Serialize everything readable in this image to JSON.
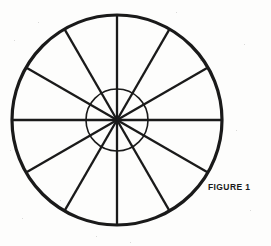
{
  "page": {
    "width": 271,
    "height": 246,
    "background_color": "#fdfdfc",
    "ink_color": "#1a1a1a"
  },
  "figure": {
    "name": "spoked-wheel-diagram",
    "caption": "FIGURE 1",
    "caption_position": {
      "x": 208,
      "y": 182
    },
    "center": {
      "x": 117,
      "y": 120
    },
    "outer_circle": {
      "radius": 105,
      "stroke_width": 3.2,
      "stroke_color": "#1a1a1a",
      "fill": "none"
    },
    "inner_circle": {
      "radius": 31,
      "stroke_width": 1.6,
      "stroke_color": "#1a1a1a",
      "fill": "none"
    },
    "spokes": {
      "count": 12,
      "angle_step_degrees": 30,
      "start_angle_degrees": 90,
      "stroke_width": 2.3,
      "stroke_color": "#1a1a1a",
      "angles_degrees": [
        90,
        120,
        150,
        180,
        210,
        240,
        270,
        300,
        330,
        0,
        30,
        60
      ]
    }
  },
  "chart_data": {
    "type": "pie",
    "title": "FIGURE 1",
    "subtitle": "",
    "xlabel": "",
    "ylabel": "",
    "legend_position": "none",
    "grid": false,
    "categories": [
      "Sector 1",
      "Sector 2",
      "Sector 3",
      "Sector 4",
      "Sector 5",
      "Sector 6",
      "Sector 7",
      "Sector 8",
      "Sector 9",
      "Sector 10",
      "Sector 11",
      "Sector 12"
    ],
    "values": [
      30,
      30,
      30,
      30,
      30,
      30,
      30,
      30,
      30,
      30,
      30,
      30
    ],
    "value_unit": "degrees",
    "annotations": [
      "Outer rim circle, radius 105 px",
      "Inner hub circle, radius 31 px",
      "12 equal spokes at 30 degree intervals"
    ]
  }
}
